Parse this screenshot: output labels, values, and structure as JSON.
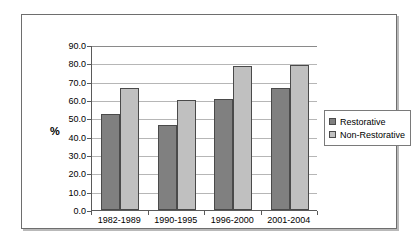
{
  "chart_data": {
    "type": "bar",
    "title": "",
    "xlabel": "",
    "ylabel": "%",
    "ylim": [
      0,
      90
    ],
    "ytick_step": 10,
    "ytick_labels": [
      "0.0",
      "10.0",
      "20.0",
      "30.0",
      "40.0",
      "50.0",
      "60.0",
      "70.0",
      "80.0",
      "90.0"
    ],
    "grid": true,
    "legend_position": "right",
    "categories": [
      "1982-1989",
      "1990-1995",
      "1996-2000",
      "2001-2004"
    ],
    "series": [
      {
        "name": "Restorative",
        "color": "#808080",
        "values": [
          52.2,
          46.6,
          60.3,
          66.3
        ]
      },
      {
        "name": "Non-Restorative",
        "color": "#c0c0c0",
        "values": [
          66.7,
          60.1,
          78.6,
          78.9
        ]
      }
    ]
  },
  "legend": {
    "items": [
      {
        "label": "Restorative",
        "swatch": "legend-swatch-restorative"
      },
      {
        "label": "Non-Restorative",
        "swatch": "legend-swatch-non-restorative"
      }
    ]
  }
}
